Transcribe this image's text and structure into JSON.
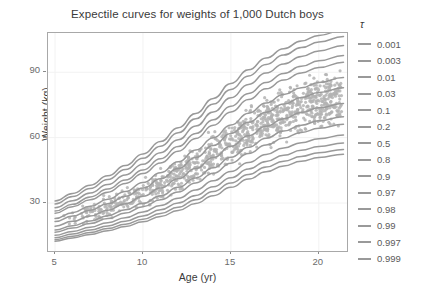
{
  "chart_data": {
    "type": "line",
    "title": "Expectile curves for weights of 1,000 Dutch boys",
    "xlabel": "Age (yr)",
    "ylabel": "Weight (kg)",
    "xlim": [
      4.6,
      21.6
    ],
    "ylim": [
      8,
      108
    ],
    "xticks": [
      5,
      10,
      15,
      20
    ],
    "yticks": [
      30,
      60,
      90
    ],
    "xtick_labels": [
      "5",
      "10",
      "15",
      "20"
    ],
    "ytick_labels": [
      "30",
      "60",
      "90"
    ],
    "grid": true,
    "grid_color": "#f2f2f2",
    "legend_position": "right",
    "legend_title": "τ",
    "line_color": "#999999",
    "point_color": "#b3b3b3",
    "panel_border_color": "#a8a8a8",
    "background": "#ffffff",
    "series": [
      {
        "name": "0.001",
        "tau": 0.001,
        "x": [
          5,
          6,
          7,
          8,
          9,
          10,
          11,
          12,
          13,
          14,
          15,
          16,
          17,
          18,
          19,
          20,
          21.4
        ],
        "values": [
          12.5,
          14.0,
          15.6,
          17.3,
          19.2,
          21.4,
          23.8,
          26.6,
          29.8,
          33.4,
          37.2,
          41.0,
          44.3,
          47.0,
          49.2,
          50.9,
          52.4
        ]
      },
      {
        "name": "0.003",
        "tau": 0.003,
        "x": [
          5,
          6,
          7,
          8,
          9,
          10,
          11,
          12,
          13,
          14,
          15,
          16,
          17,
          18,
          19,
          20,
          21.4
        ],
        "values": [
          13.2,
          14.8,
          16.5,
          18.3,
          20.3,
          22.6,
          25.2,
          28.1,
          31.5,
          35.3,
          39.2,
          43.1,
          46.5,
          49.2,
          51.4,
          53.1,
          54.6
        ]
      },
      {
        "name": "0.01",
        "tau": 0.01,
        "x": [
          5,
          6,
          7,
          8,
          9,
          10,
          11,
          12,
          13,
          14,
          15,
          16,
          17,
          18,
          19,
          20,
          21.4
        ],
        "values": [
          14.1,
          15.8,
          17.6,
          19.5,
          21.7,
          24.1,
          26.9,
          30.0,
          33.5,
          37.5,
          41.6,
          45.6,
          49.1,
          51.9,
          54.2,
          55.9,
          57.5
        ]
      },
      {
        "name": "0.03",
        "tau": 0.03,
        "x": [
          5,
          6,
          7,
          8,
          9,
          10,
          11,
          12,
          13,
          14,
          15,
          16,
          17,
          18,
          19,
          20,
          21.4
        ],
        "values": [
          15.2,
          17.0,
          18.9,
          21.0,
          23.3,
          25.9,
          28.9,
          32.2,
          36.0,
          40.2,
          44.5,
          48.6,
          52.3,
          55.3,
          57.7,
          59.5,
          61.2
        ]
      },
      {
        "name": "0.1",
        "tau": 0.1,
        "x": [
          5,
          6,
          7,
          8,
          9,
          10,
          11,
          12,
          13,
          14,
          15,
          16,
          17,
          18,
          19,
          20,
          21.4
        ],
        "values": [
          16.6,
          18.5,
          20.6,
          22.9,
          25.4,
          28.3,
          31.5,
          35.1,
          39.2,
          43.7,
          48.3,
          52.7,
          56.6,
          59.8,
          62.4,
          64.3,
          66.1
        ]
      },
      {
        "name": "0.2",
        "tau": 0.2,
        "x": [
          5,
          6,
          7,
          8,
          9,
          10,
          11,
          12,
          13,
          14,
          15,
          16,
          17,
          18,
          19,
          20,
          21.4
        ],
        "values": [
          17.6,
          19.6,
          21.8,
          24.2,
          26.9,
          29.9,
          33.3,
          37.2,
          41.5,
          46.2,
          51.0,
          55.6,
          59.7,
          63.0,
          65.7,
          67.7,
          69.6
        ]
      },
      {
        "name": "0.5",
        "tau": 0.5,
        "x": [
          5,
          6,
          7,
          8,
          9,
          10,
          11,
          12,
          13,
          14,
          15,
          16,
          17,
          18,
          19,
          20,
          21.4
        ],
        "values": [
          19.4,
          21.6,
          24.0,
          26.7,
          29.7,
          33.1,
          36.9,
          41.1,
          45.8,
          50.9,
          56.0,
          60.9,
          65.2,
          68.7,
          71.5,
          73.7,
          75.7
        ]
      },
      {
        "name": "0.8",
        "tau": 0.8,
        "x": [
          5,
          6,
          7,
          8,
          9,
          10,
          11,
          12,
          13,
          14,
          15,
          16,
          17,
          18,
          19,
          20,
          21.4
        ],
        "values": [
          21.5,
          24.0,
          26.7,
          29.7,
          33.1,
          36.9,
          41.1,
          45.8,
          50.9,
          56.4,
          61.9,
          67.1,
          71.7,
          75.4,
          78.4,
          80.7,
          82.9
        ]
      },
      {
        "name": "0.9",
        "tau": 0.9,
        "x": [
          5,
          6,
          7,
          8,
          9,
          10,
          11,
          12,
          13,
          14,
          15,
          16,
          17,
          18,
          19,
          20,
          21.4
        ],
        "values": [
          22.9,
          25.6,
          28.5,
          31.7,
          35.3,
          39.4,
          43.9,
          48.9,
          54.3,
          60.0,
          65.8,
          71.2,
          75.9,
          79.8,
          82.9,
          85.3,
          87.6
        ]
      },
      {
        "name": "0.97",
        "tau": 0.97,
        "x": [
          5,
          6,
          7,
          8,
          9,
          10,
          11,
          12,
          13,
          14,
          15,
          16,
          17,
          18,
          19,
          20,
          21.4
        ],
        "values": [
          25.3,
          28.3,
          31.5,
          35.0,
          39.0,
          43.5,
          48.4,
          53.8,
          59.6,
          65.7,
          71.8,
          77.5,
          82.4,
          86.4,
          89.7,
          92.2,
          94.6
        ]
      },
      {
        "name": "0.98",
        "tau": 0.98,
        "x": [
          5,
          6,
          7,
          8,
          9,
          10,
          11,
          12,
          13,
          14,
          15,
          16,
          17,
          18,
          19,
          20,
          21.4
        ],
        "values": [
          26.3,
          29.4,
          32.8,
          36.4,
          40.6,
          45.2,
          50.3,
          55.9,
          61.9,
          68.2,
          74.4,
          80.3,
          85.3,
          89.4,
          92.7,
          95.3,
          97.7
        ]
      },
      {
        "name": "0.99",
        "tau": 0.99,
        "x": [
          5,
          6,
          7,
          8,
          9,
          10,
          11,
          12,
          13,
          14,
          15,
          16,
          17,
          18,
          19,
          20,
          21.4
        ],
        "values": [
          27.8,
          31.1,
          34.6,
          38.5,
          42.9,
          47.8,
          53.1,
          59.0,
          65.3,
          71.8,
          78.3,
          84.4,
          89.6,
          93.8,
          97.2,
          99.8,
          102.3
        ]
      },
      {
        "name": "0.997",
        "tau": 0.997,
        "x": [
          5,
          6,
          7,
          8,
          9,
          10,
          11,
          12,
          13,
          14,
          15,
          16,
          17,
          18,
          19,
          20,
          21.4
        ],
        "values": [
          29.6,
          33.0,
          36.7,
          40.8,
          45.4,
          50.5,
          56.1,
          62.2,
          68.7,
          75.4,
          82.1,
          88.3,
          93.6,
          97.9,
          101.3,
          103.9,
          106.4
        ]
      },
      {
        "name": "0.999",
        "tau": 0.999,
        "x": [
          5,
          6,
          7,
          8,
          9,
          10,
          11,
          12,
          13,
          14,
          15,
          16,
          17,
          18,
          19,
          20,
          21.4
        ],
        "values": [
          30.9,
          34.4,
          38.2,
          42.5,
          47.2,
          52.5,
          58.2,
          64.5,
          71.1,
          78.0,
          84.8,
          91.1,
          96.5,
          100.8,
          104.3,
          106.9,
          109.4
        ]
      }
    ],
    "scatter": {
      "name": "Dutch boys weight observations",
      "n_points": 1000,
      "color": "#b3b3b3",
      "marker": "circle",
      "size": 1.6
    }
  },
  "legend": {
    "title": "τ",
    "items": [
      {
        "label": "0.001"
      },
      {
        "label": "0.003"
      },
      {
        "label": "0.01"
      },
      {
        "label": "0.03"
      },
      {
        "label": "0.1"
      },
      {
        "label": "0.2"
      },
      {
        "label": "0.5"
      },
      {
        "label": "0.8"
      },
      {
        "label": "0.9"
      },
      {
        "label": "0.97"
      },
      {
        "label": "0.98"
      },
      {
        "label": "0.99"
      },
      {
        "label": "0.997"
      },
      {
        "label": "0.999"
      }
    ]
  }
}
